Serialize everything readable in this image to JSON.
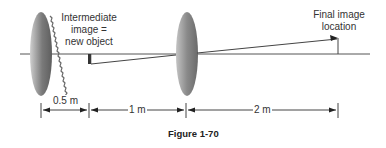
{
  "figure": {
    "caption": "Figure 1-70",
    "labels": {
      "intermediate_line1": "Intermediate",
      "intermediate_line2": "image =",
      "intermediate_line3": "new object",
      "final_line1": "Final image",
      "final_line2": "location"
    },
    "dimensions": [
      {
        "label": "0.5 m",
        "from": "lens-1",
        "to": "intermediate-image"
      },
      {
        "label": "1 m",
        "from": "intermediate-image",
        "to": "lens-2"
      },
      {
        "label": "2 m",
        "from": "lens-2",
        "to": "final-image"
      }
    ],
    "elements": {
      "lens_1": "first lens (serrated edge)",
      "lens_2": "second converging lens",
      "optical_axis": "horizontal axis line",
      "intermediate_image": "inverted short image bar",
      "final_image": "upright arrow at final image location"
    },
    "colors": {
      "lens_dark": "#6e6e6e",
      "lens_light": "#c8c8c8",
      "line": "#444444"
    }
  }
}
